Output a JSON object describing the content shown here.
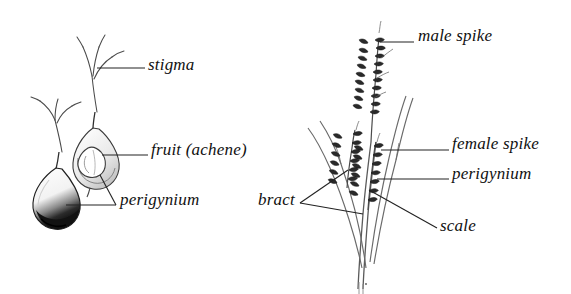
{
  "figure": {
    "background_color": "#ffffff",
    "ink_color": "#1a1a1a",
    "leader_color": "#222222"
  },
  "panels": [
    {
      "name": "perigynium-detail-panel",
      "description": "Left panel: isolated perigynium with stigmas and a cutaway perigynium revealing the achene inside"
    },
    {
      "name": "inflorescence-panel",
      "description": "Right panel: whole sedge culm bearing a terminal male spike and two lateral female spikes subtended by long bracts"
    }
  ],
  "labels": [
    {
      "id": "stigma",
      "text": "stigma",
      "x": 148,
      "y": 63,
      "panel": "perigynium-detail-panel"
    },
    {
      "id": "fruit-achene",
      "text": "fruit (achene)",
      "x": 151,
      "y": 148,
      "panel": "perigynium-detail-panel"
    },
    {
      "id": "perigynium-left",
      "text": "perigynium",
      "x": 120,
      "y": 198,
      "panel": "perigynium-detail-panel"
    },
    {
      "id": "male-spike",
      "text": "male spike",
      "x": 418,
      "y": 34,
      "panel": "inflorescence-panel"
    },
    {
      "id": "female-spike",
      "text": "female spike",
      "x": 452,
      "y": 142,
      "panel": "inflorescence-panel"
    },
    {
      "id": "perigynium-right",
      "text": "perigynium",
      "x": 452,
      "y": 172,
      "panel": "inflorescence-panel"
    },
    {
      "id": "bract",
      "text": "bract",
      "x": 258,
      "y": 198,
      "panel": "inflorescence-panel"
    },
    {
      "id": "scale",
      "text": "scale",
      "x": 440,
      "y": 224,
      "panel": "inflorescence-panel"
    }
  ],
  "structures": [
    {
      "name": "perigynium-solid",
      "panel": "perigynium-detail-panel",
      "note": "flask-shaped sac, shaded dark at the base"
    },
    {
      "name": "perigynium-cutaway",
      "panel": "perigynium-detail-panel",
      "note": "outline sac showing enclosed achene"
    },
    {
      "name": "achene",
      "panel": "perigynium-detail-panel",
      "note": "small lens-shaped fruit inside the sac"
    },
    {
      "name": "stigma-filaments",
      "panel": "perigynium-detail-panel",
      "note": "three slender branches emerging from the sac apex"
    },
    {
      "name": "male-spike",
      "panel": "inflorescence-panel",
      "note": "terminal staminate spike at the top of the culm"
    },
    {
      "name": "female-spike-upper",
      "panel": "inflorescence-panel",
      "note": "upper pistillate spike"
    },
    {
      "name": "female-spike-lower",
      "panel": "inflorescence-panel",
      "note": "lower pistillate spike"
    },
    {
      "name": "bract-upper",
      "panel": "inflorescence-panel",
      "note": "long leaf-like bract subtending the upper spike"
    },
    {
      "name": "bract-lower",
      "panel": "inflorescence-panel",
      "note": "long leaf-like bract subtending the lower spike"
    },
    {
      "name": "culm",
      "panel": "inflorescence-panel",
      "note": "central stem"
    }
  ]
}
